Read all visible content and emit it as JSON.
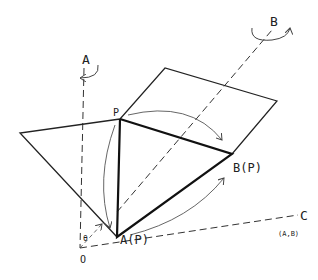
{
  "diagram": {
    "labels": {
      "axis_a": "A",
      "axis_b": "B",
      "axis_c": "C",
      "axis_c_sub": "(A,B)",
      "point_p": "P",
      "point_ap": "A(P)",
      "point_bp": "B(P)",
      "origin": "O",
      "angle": "θ"
    },
    "points": {
      "O": [
        80,
        248
      ],
      "P": [
        120,
        119
      ],
      "A_P": [
        117,
        237
      ],
      "B_P": [
        232,
        154
      ],
      "left_vertex": [
        20,
        133
      ],
      "para_tl": [
        165,
        68
      ],
      "para_tr": [
        277,
        101
      ]
    }
  }
}
